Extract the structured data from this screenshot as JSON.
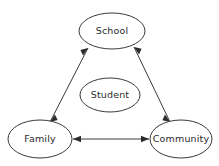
{
  "diagram": {
    "background_color": "#ffffff",
    "stroke_color": "#3a3a3a",
    "text_color": "#2b2b2b",
    "nodes": [
      {
        "id": "school",
        "label": "School",
        "cx": 112,
        "cy": 31,
        "rx": 33,
        "ry": 18
      },
      {
        "id": "student",
        "label": "Student",
        "cx": 110,
        "cy": 95,
        "rx": 30,
        "ry": 17
      },
      {
        "id": "family",
        "label": "Family",
        "cx": 40,
        "cy": 139,
        "rx": 32,
        "ry": 19
      },
      {
        "id": "community",
        "label": "Community",
        "cx": 181,
        "cy": 139,
        "rx": 31,
        "ry": 19
      }
    ],
    "edges": [
      {
        "id": "family-school",
        "from": "family",
        "to": "school",
        "style": "double-arrow",
        "x1": 50,
        "y1": 122,
        "x2": 88,
        "y2": 48
      },
      {
        "id": "school-community",
        "from": "school",
        "to": "community",
        "style": "double-arrow",
        "x1": 134,
        "y1": 47,
        "x2": 170,
        "y2": 122
      },
      {
        "id": "family-community",
        "from": "family",
        "to": "community",
        "style": "double-arrow",
        "x1": 73,
        "y1": 139,
        "x2": 149,
        "y2": 139
      }
    ]
  }
}
